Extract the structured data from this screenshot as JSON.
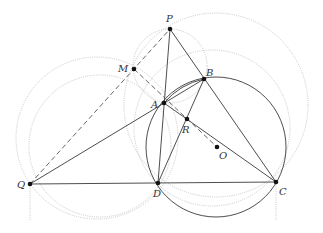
{
  "diagram": {
    "type": "geometry",
    "colors": {
      "solid": "#3a3a3a",
      "dashed": "#555555",
      "dotted": "#c8c8c8",
      "point": "#111111",
      "label": "#333333"
    },
    "points": {
      "P": {
        "label": "P",
        "x": 170,
        "y": 29
      },
      "M": {
        "label": "M",
        "x": 134,
        "y": 69
      },
      "B": {
        "label": "B",
        "x": 204,
        "y": 79
      },
      "A": {
        "label": "A",
        "x": 164,
        "y": 103
      },
      "R": {
        "label": "R",
        "x": 187,
        "y": 119
      },
      "O": {
        "label": "O",
        "x": 217,
        "y": 147
      },
      "Q": {
        "label": "Q",
        "x": 30,
        "y": 184
      },
      "D": {
        "label": "D",
        "x": 158,
        "y": 183
      },
      "C": {
        "label": "C",
        "x": 276,
        "y": 182
      }
    },
    "solid_segments": [
      [
        "P",
        "D"
      ],
      [
        "P",
        "C"
      ],
      [
        "Q",
        "B"
      ],
      [
        "Q",
        "C"
      ],
      [
        "D",
        "B"
      ],
      [
        "A",
        "C"
      ]
    ],
    "dashed_segments": [
      [
        "Q",
        "P"
      ],
      [
        "M",
        "O"
      ]
    ],
    "solid_circles": [
      {
        "name": "circumcircle-ABCD",
        "cx": 216,
        "cy": 147,
        "r": 70
      }
    ],
    "dotted_circles": [
      {
        "name": "circle-PMAB",
        "cx": 170,
        "cy": 66,
        "r": 37
      },
      {
        "name": "circle-MPC",
        "cx": 216,
        "cy": 105,
        "r": 92
      },
      {
        "name": "circle-QMD",
        "cx": 97,
        "cy": 138,
        "r": 81
      },
      {
        "name": "circle-QAD",
        "cx": 100,
        "cy": 146,
        "r": 71
      },
      {
        "name": "circle-MBDC",
        "cx": 212,
        "cy": 128,
        "r": 78
      }
    ]
  }
}
